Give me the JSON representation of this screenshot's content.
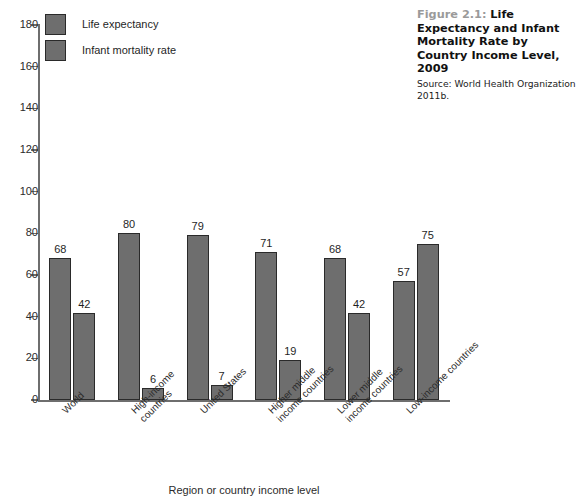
{
  "caption": {
    "figure_number": "Figure 2.1:",
    "title": "Life Expectancy and Infant Mortality Rate by Country Income Level, 2009",
    "source": "Source: World Health Organization 2011b."
  },
  "colors": {
    "bar_fill": "#6e6e6e",
    "bar_border": "#2a2a2a",
    "axis": "#6e6e6e",
    "figure_number": "#9a9a9a",
    "text": "#1f1f1f",
    "background": "#ffffff"
  },
  "chart_data": {
    "type": "bar",
    "title": "Life Expectancy and Infant Mortality Rate by Country Income Level, 2009",
    "xlabel": "Region or country income level",
    "ylabel": "",
    "ylim": [
      0,
      180
    ],
    "yticks": [
      0,
      20,
      40,
      60,
      80,
      100,
      120,
      140,
      160,
      180
    ],
    "grid": false,
    "legend_position": "top-left",
    "categories": [
      "World",
      "High-income\ncountries",
      "United States",
      "Higher middle\nincome countries",
      "Lower middle\nincome countries",
      "Low-income countries"
    ],
    "series": [
      {
        "name": "Life expectancy",
        "values": [
          68,
          80,
          79,
          71,
          68,
          57
        ]
      },
      {
        "name": "Infant mortality rate",
        "values": [
          42,
          6,
          7,
          19,
          42,
          75
        ]
      }
    ]
  }
}
